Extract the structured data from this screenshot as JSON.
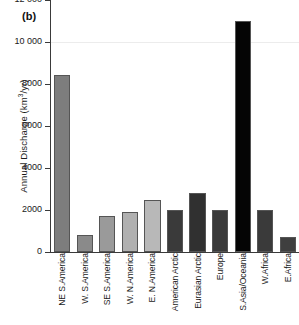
{
  "panel": {
    "label": "(b)"
  },
  "chart_data": {
    "type": "bar",
    "title": "",
    "subtitle": "",
    "xlabel": "",
    "ylabel": "Annual Discharge (km3/yr)",
    "ylabel_parts": {
      "prefix": "Annual Discharge (km",
      "superscript": "3",
      "suffix": "/yr)"
    },
    "ylim": [
      0,
      12000
    ],
    "yticks": [
      0,
      2000,
      4000,
      6000,
      8000,
      10000,
      12000
    ],
    "ytick_labels": [
      "0",
      "2000",
      "4000",
      "6000",
      "8000",
      "10 000",
      "12 000"
    ],
    "grid": "faint horizontal at 10 000",
    "legend": "none",
    "categories": [
      "NE S.America",
      "W. S.America",
      "SE S.America",
      "W. N.America",
      "E. N.America",
      "American Arctic",
      "Eurasian Arctic",
      "Europe",
      "S.Asia/Oceania",
      "W.Africa",
      "E.Africa"
    ],
    "values": [
      8450,
      800,
      1700,
      1900,
      2500,
      2000,
      2800,
      2000,
      11000,
      2000,
      700
    ],
    "bar_colors": [
      "#7d7d7d",
      "#8a8a8a",
      "#9a9a9a",
      "#b0b0b0",
      "#b8b8b8",
      "#3a3a3a",
      "#303030",
      "#3a3a3a",
      "#050505",
      "#3a3a3a",
      "#3f3f3f"
    ]
  }
}
